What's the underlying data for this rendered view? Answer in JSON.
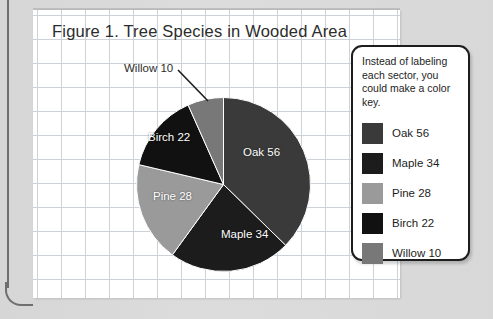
{
  "chart_data": {
    "type": "pie",
    "title": "Figure 1. Tree Species in Wooded Area",
    "categories": [
      "Oak",
      "Maple",
      "Pine",
      "Birch",
      "Willow"
    ],
    "values": [
      56,
      34,
      28,
      22,
      10
    ],
    "total": 150,
    "start_angle_deg": 0,
    "direction": "clockwise",
    "legend_position": "right",
    "grid": true,
    "slices": [
      {
        "label": "Oak 56",
        "name": "Oak",
        "value": 56,
        "color": "#3a3a3a",
        "label_color": "#ffffff",
        "label_placement": "inside"
      },
      {
        "label": "Maple 34",
        "name": "Maple",
        "value": 34,
        "color": "#1c1c1c",
        "label_color": "#ffffff",
        "label_placement": "inside"
      },
      {
        "label": "Pine 28",
        "name": "Pine",
        "value": 28,
        "color": "#9a9a9a",
        "label_color": "#ffffff",
        "label_placement": "inside"
      },
      {
        "label": "Birch 22",
        "name": "Birch",
        "value": 22,
        "color": "#111111",
        "label_color": "#ffffff",
        "label_placement": "inside"
      },
      {
        "label": "Willow 10",
        "name": "Willow",
        "value": 10,
        "color": "#787878",
        "label_color": "#2c2c2c",
        "label_placement": "callout"
      }
    ]
  },
  "legend": {
    "note": "Instead of labeling each sector, you could make a color key.",
    "items": [
      {
        "label": "Oak 56",
        "color": "#3a3a3a"
      },
      {
        "label": "Maple 34",
        "color": "#1c1c1c"
      },
      {
        "label": "Pine 28",
        "color": "#9a9a9a"
      },
      {
        "label": "Birch 22",
        "color": "#111111"
      },
      {
        "label": "Willow 10",
        "color": "#787878"
      }
    ]
  },
  "colors": {
    "page_background": "#d8d8d8",
    "sheet": "#ffffff",
    "grid_line": "#ccd2d8",
    "binder_rule": "#6f6f6f",
    "text": "#2c2c2c",
    "legend_border": "#1d1d1d"
  }
}
